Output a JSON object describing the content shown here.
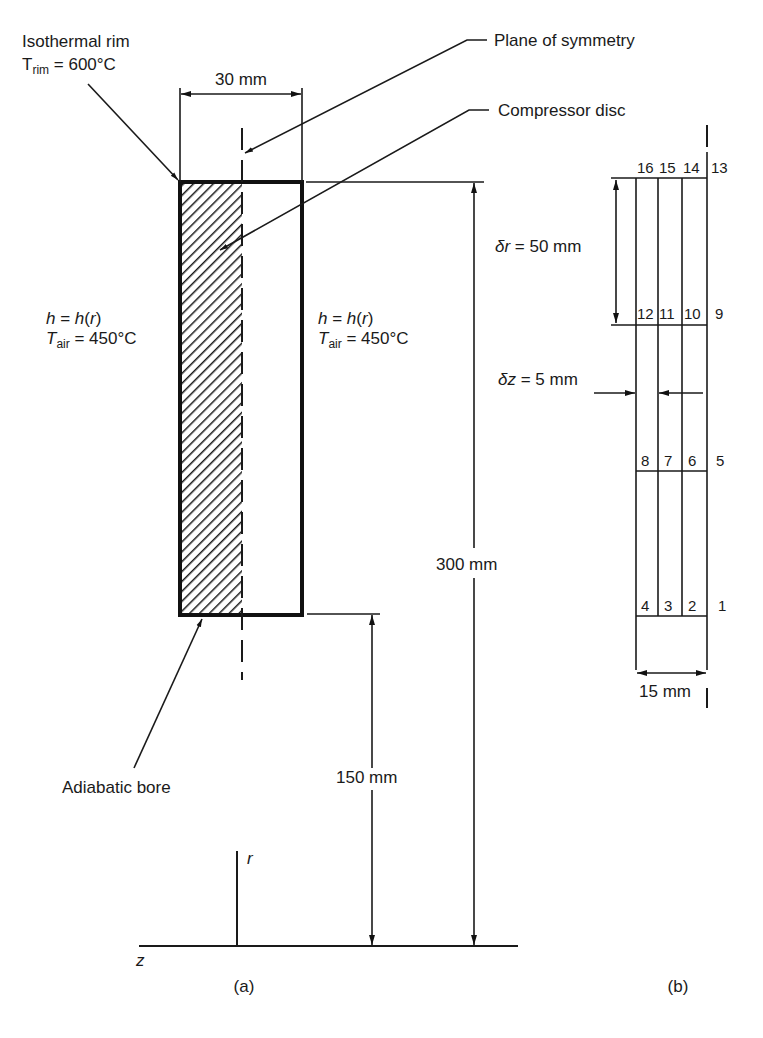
{
  "panel_a": {
    "caption": "(a)",
    "rim": {
      "title": "Isothermal rim",
      "T_sym": "T",
      "T_sub": "rim",
      "value": " = 600°C"
    },
    "plane_of_symmetry": "Plane of symmetry",
    "compressor_disc": "Compressor disc",
    "width_dim": "30 mm",
    "left_bc": {
      "h_line_h": "h",
      "h_line_mid": " = ",
      "h_line_h2": "h",
      "h_line_open": "(",
      "h_line_r": "r",
      "h_line_close": ")",
      "T_sym": "T",
      "T_sub": "air",
      "value": " = 450°C"
    },
    "right_bc": {
      "h_line_h": "h",
      "h_line_mid": " = ",
      "h_line_h2": "h",
      "h_line_open": "(",
      "h_line_r": "r",
      "h_line_close": ")",
      "T_sym": "T",
      "T_sub": "air",
      "value": " = 450°C"
    },
    "height_dim": "300 mm",
    "bore_dim": "150 mm",
    "bore_label": "Adiabatic bore",
    "axis_r": "r",
    "axis_z": "z"
  },
  "panel_b": {
    "caption": "(b)",
    "dr_sym": "δr",
    "dr_value": " = 50 mm",
    "dz_sym": "δz",
    "dz_value": " = 5 mm",
    "width_dim": "15 mm",
    "node_rows": [
      [
        "16",
        "15",
        "14",
        "13"
      ],
      [
        "12",
        "11",
        "10",
        "9"
      ],
      [
        "8",
        "7",
        "6",
        "5"
      ],
      [
        "4",
        "3",
        "2",
        "1"
      ]
    ]
  },
  "colors": {
    "ink": "#1a1a1a",
    "background": "#ffffff"
  }
}
